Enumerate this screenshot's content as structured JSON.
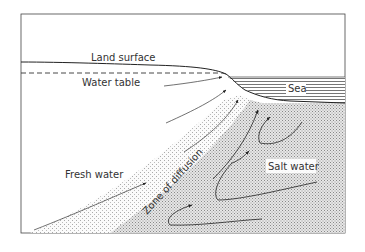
{
  "diagram": {
    "labels": {
      "land_surface": "Land surface",
      "water_table": "Water table",
      "sea": "Sea",
      "fresh_water": "Fresh water",
      "zone_of_diffusion": "Zone of diffusion",
      "salt_water": "Salt water"
    },
    "colors": {
      "line": "#333333",
      "salt_fill": "#d8d8d8",
      "background": "#ffffff"
    }
  }
}
